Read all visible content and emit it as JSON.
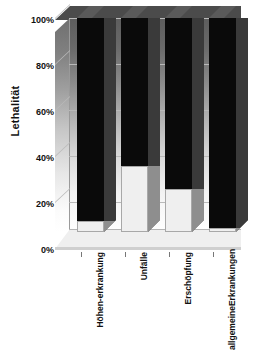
{
  "chart_data": {
    "type": "bar",
    "stacked": true,
    "title": "",
    "xlabel": "",
    "ylabel": "Lethalität",
    "ylim": [
      0,
      100
    ],
    "yticks": [
      0,
      20,
      40,
      60,
      80,
      100
    ],
    "ytick_labels": [
      "0%",
      "20%",
      "40%",
      "60%",
      "80%",
      "100%"
    ],
    "grid": true,
    "legend": "none",
    "categories": [
      "Höhen-\nerkrankung",
      "Unfälle",
      "Erschöpfung",
      "allgemeine\nErkrankungen"
    ],
    "category_lines": [
      [
        "Höhen-",
        "erkrankung"
      ],
      [
        "Unfälle",
        ""
      ],
      [
        "Erschöpfung",
        ""
      ],
      [
        "allgemeine",
        "Erkrankungen"
      ]
    ],
    "series": [
      {
        "name": "überlebt",
        "color": "#efefef",
        "values": [
          5,
          31,
          20,
          2
        ]
      },
      {
        "name": "letal",
        "color": "#0a0a0a",
        "values": [
          95,
          69,
          80,
          98
        ]
      }
    ],
    "value_labels": [
      "5%",
      "31%",
      "20%",
      "2%"
    ]
  },
  "axis": {
    "y_title": "Lethalität",
    "ticks": [
      "100%",
      "80%",
      "60%",
      "40%",
      "20%",
      "0%"
    ]
  },
  "colors": {
    "bar_dark": "#0a0a0a",
    "bar_light": "#efefef",
    "bar_side": "#4a4a4a",
    "bar_top": "#5a5a5a",
    "wall_top": "#5d5d5d",
    "wall_bottom": "#ffffff",
    "gridline": "#b9b9b9",
    "text": "#111111",
    "background": "#ffffff"
  }
}
